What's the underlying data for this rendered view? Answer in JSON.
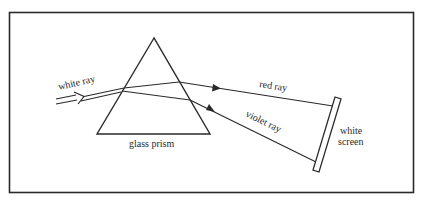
{
  "diagram": {
    "colors": {
      "ink": "#2a2a2a",
      "background": "#ffffff"
    },
    "labels": {
      "white_ray": "white ray",
      "glass_prism": "glass prism",
      "red_ray": "red ray",
      "violet_ray": "violet ray",
      "white_screen_line1": "white",
      "white_screen_line2": "screen"
    },
    "components": [
      {
        "id": "frame",
        "type": "border"
      },
      {
        "id": "incident-ray",
        "type": "double-line arrow",
        "label": "white ray"
      },
      {
        "id": "prism",
        "type": "triangle",
        "label": "glass prism"
      },
      {
        "id": "red-ray",
        "type": "arrow line",
        "label": "red ray"
      },
      {
        "id": "violet-ray",
        "type": "arrow line",
        "label": "violet ray"
      },
      {
        "id": "screen",
        "type": "rectangle",
        "label": "white screen"
      }
    ]
  }
}
